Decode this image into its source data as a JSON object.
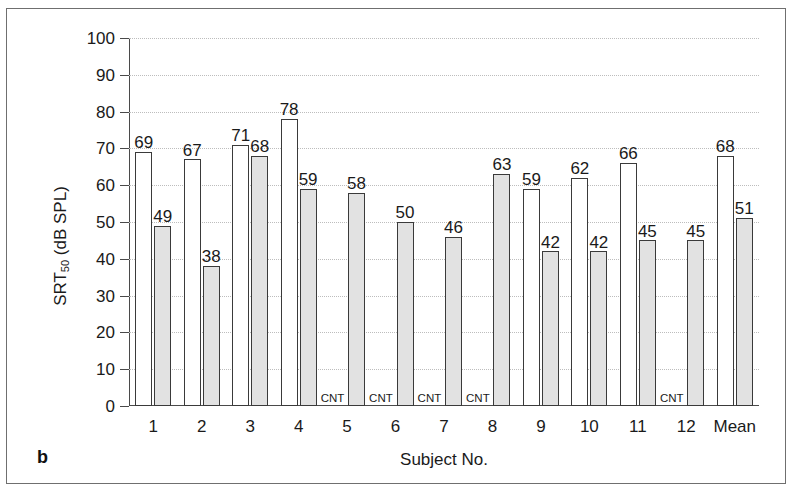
{
  "panel": {
    "label": "b"
  },
  "chart_data": {
    "type": "bar",
    "title": "",
    "xlabel": "Subject No.",
    "ylabel": "SRT50 (dB SPL)",
    "ylabel_base": "SRT",
    "ylabel_sub": "50",
    "ylabel_unit": " (dB SPL)",
    "ylim": [
      0,
      100
    ],
    "ytick_step": 10,
    "yticks": [
      100,
      90,
      80,
      70,
      60,
      50,
      40,
      30,
      20,
      10,
      0
    ],
    "grid": true,
    "legend": "none",
    "missing_marker": "CNT",
    "categories": [
      "1",
      "2",
      "3",
      "4",
      "5",
      "6",
      "7",
      "8",
      "9",
      "10",
      "11",
      "12",
      "Mean"
    ],
    "series": [
      {
        "name": "white",
        "fill": "#ffffff",
        "values": [
          69,
          67,
          71,
          78,
          null,
          null,
          null,
          null,
          59,
          62,
          66,
          null,
          68
        ]
      },
      {
        "name": "gray",
        "fill": "#e2e2e2",
        "values": [
          49,
          38,
          68,
          59,
          58,
          50,
          46,
          63,
          42,
          42,
          45,
          45,
          51
        ]
      }
    ]
  },
  "colors": {
    "frame": "#6f6f6f",
    "axis": "#4a4a4a",
    "grid": "#bdbdbd",
    "bar_outline": "#3a3a3a",
    "bar_white": "#ffffff",
    "bar_gray": "#e2e2e2",
    "text": "#1a1a1a"
  }
}
